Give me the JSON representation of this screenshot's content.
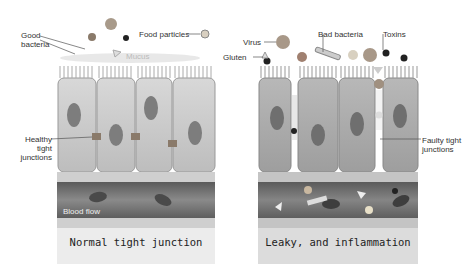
{
  "left_panel": {
    "labels": {
      "good_bacteria": "Good bacteria",
      "food_particles": "Food particles",
      "mucus": "Mucus",
      "healthy_junctions": "Healthy tight junctions",
      "blood_flow": "Blood flow"
    },
    "caption": "Normal tight junction"
  },
  "right_panel": {
    "labels": {
      "virus": "Virus",
      "bad_bacteria": "Bad bacteria",
      "toxins": "Toxins",
      "gluten": "Gluten",
      "faulty_junctions": "Faulty tight junctions"
    },
    "caption": "Leaky, and inflammation"
  },
  "colors": {
    "cell": "#c9c9c9",
    "cell_dark": "#a8a8a8",
    "nucleus": "#7a7a7a",
    "vessel": "#6e6e6e",
    "caption_bg": "#e6e6e6"
  }
}
